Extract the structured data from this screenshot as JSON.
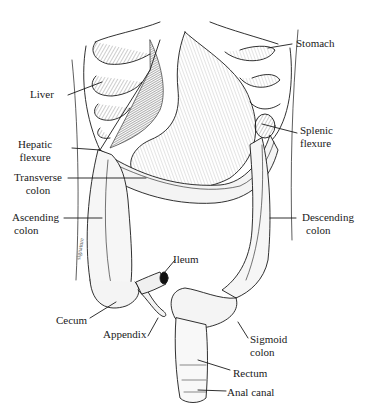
{
  "figure": {
    "colors": {
      "ink": "#1a1a1a",
      "background": "#ffffff",
      "shade": "#cfcfcf"
    }
  },
  "labels": {
    "stomach": {
      "line1": "Stomach"
    },
    "liver": {
      "line1": "Liver"
    },
    "hepatic_flexure": {
      "line1": "Hepatic",
      "line2": "flexure"
    },
    "splenic_flexure": {
      "line1": "Splenic",
      "line2": "flexure"
    },
    "transverse_colon": {
      "line1": "Transverse",
      "line2": "colon"
    },
    "ascending_colon": {
      "line1": "Ascending",
      "line2": "colon"
    },
    "descending_colon": {
      "line1": "Descending",
      "line2": "colon"
    },
    "ileum": {
      "line1": "Ileum"
    },
    "cecum": {
      "line1": "Cecum"
    },
    "appendix": {
      "line1": "Appendix"
    },
    "sigmoid_colon": {
      "line1": "Sigmoid",
      "line2": "colon"
    },
    "rectum": {
      "line1": "Rectum"
    },
    "anal_canal": {
      "line1": "Anal canal"
    }
  }
}
